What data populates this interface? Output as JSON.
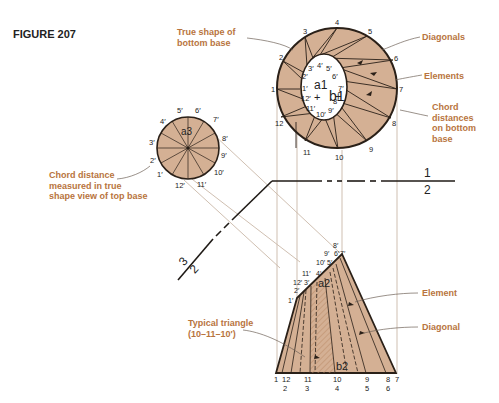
{
  "figure": {
    "title": "FIGURE 207"
  },
  "callouts": {
    "true_shape": [
      "True shape of",
      "bottom base"
    ],
    "diagonals": "Diagonals",
    "elements": "Elements",
    "chord_bottom": [
      "Chord",
      "distances",
      "on bottom",
      "base"
    ],
    "chord_top": [
      "Chord distance",
      "measured in true",
      "shape view of top base"
    ],
    "typical_triangle": [
      "Typical triangle",
      "(10–11–10′)"
    ],
    "element": "Element",
    "diagonal": "Diagonal"
  },
  "top_view": {
    "outer_labels": [
      "1",
      "2",
      "3",
      "4",
      "5",
      "6",
      "7",
      "8",
      "9",
      "10",
      "11",
      "12"
    ],
    "inner_labels": [
      "1′",
      "2′",
      "3′",
      "4′",
      "5′",
      "6′",
      "7′",
      "8′",
      "9′",
      "10′",
      "11′",
      "12′"
    ],
    "center_a": "a1",
    "center_b": "b1"
  },
  "true_top_view": {
    "labels": [
      "1′",
      "2′",
      "3′",
      "4′",
      "5′",
      "6′",
      "7′",
      "8′",
      "9′",
      "10′",
      "11′",
      "12′"
    ],
    "center": "a3"
  },
  "folding_lines": {
    "line_12_top": "1",
    "line_12_bottom": "2",
    "line_23_a": "3",
    "line_23_b": "2"
  },
  "front_view": {
    "apex_labels": [
      "8′",
      "9′",
      "6′",
      "7′",
      "10′",
      "5′",
      "11′",
      "4′",
      "12′",
      "3′",
      "2′",
      "1′"
    ],
    "apex_center": "a2",
    "base_center": "b2",
    "base_top_row": [
      "1",
      "12",
      "11",
      "10",
      "9",
      "8",
      "7"
    ],
    "base_bottom_row": [
      "2",
      "3",
      "4",
      "5",
      "6"
    ]
  },
  "colors": {
    "fill": "#d4b094",
    "line": "#2a2018",
    "projector": "#c9b8a8",
    "label": "#b8743e"
  }
}
